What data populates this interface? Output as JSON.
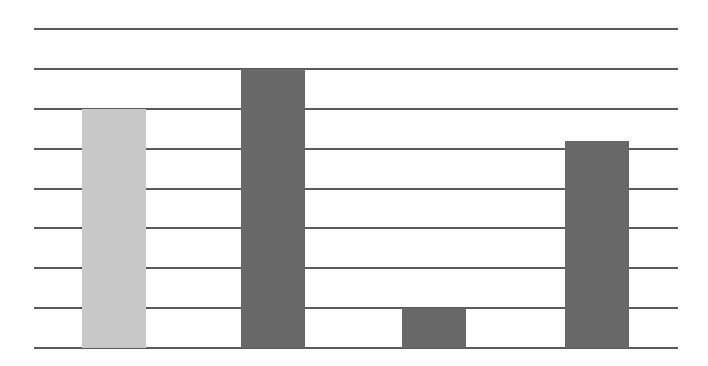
{
  "chart_data": {
    "type": "bar",
    "title": "",
    "xlabel": "",
    "ylabel": "",
    "categories": [
      "",
      "",
      "",
      ""
    ],
    "values": [
      6,
      7,
      1,
      5.2
    ],
    "bar_colors": [
      "#c8c8c8",
      "#686868",
      "#686868",
      "#686868"
    ],
    "ylim": [
      0,
      8
    ],
    "grid": true,
    "gridline_count": 9,
    "legend": null
  },
  "layout": {
    "plot_left": 34,
    "plot_right": 678,
    "plot_top": 29,
    "plot_bottom": 348,
    "bar_width": 64,
    "bar_lefts": [
      82,
      241,
      402,
      565
    ],
    "gridline_color": "#5a5a5a"
  }
}
